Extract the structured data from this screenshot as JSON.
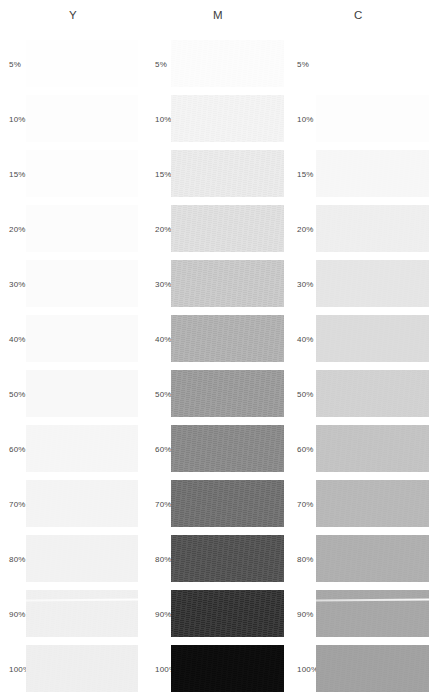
{
  "sheet": {
    "background": "#ffffff",
    "clipped_top_text": "",
    "label_color": "#4a4a4a",
    "header_color": "#3d3d3d"
  },
  "chart_data": {
    "type": "table",
    "title": "",
    "xlabel": "",
    "ylabel": "",
    "categories": [
      "5%",
      "10%",
      "15%",
      "20%",
      "30%",
      "40%",
      "50%",
      "60%",
      "70%",
      "80%",
      "90%",
      "100%"
    ],
    "series": [
      {
        "name": "Y",
        "values": [
          5,
          10,
          15,
          20,
          30,
          40,
          50,
          60,
          70,
          80,
          90,
          100
        ]
      },
      {
        "name": "M",
        "values": [
          5,
          10,
          15,
          20,
          30,
          40,
          50,
          60,
          70,
          80,
          90,
          100
        ]
      },
      {
        "name": "C",
        "values": [
          5,
          10,
          15,
          20,
          30,
          40,
          50,
          60,
          70,
          80,
          90,
          100
        ]
      }
    ]
  },
  "columns": [
    {
      "id": "y",
      "header": "Y",
      "steps": [
        {
          "label": "5%",
          "swatch": "#fefefe",
          "screen": 0.0,
          "streak": false
        },
        {
          "label": "10%",
          "swatch": "#fdfdfd",
          "screen": 0.0,
          "streak": false
        },
        {
          "label": "15%",
          "swatch": "#fdfdfd",
          "screen": 0.0,
          "streak": false
        },
        {
          "label": "20%",
          "swatch": "#fcfcfc",
          "screen": 0.0,
          "streak": false
        },
        {
          "label": "30%",
          "swatch": "#fbfbfb",
          "screen": 0.0,
          "streak": false
        },
        {
          "label": "40%",
          "swatch": "#fafafa",
          "screen": 0.0,
          "streak": false
        },
        {
          "label": "50%",
          "swatch": "#f8f8f8",
          "screen": 0.0,
          "streak": false
        },
        {
          "label": "60%",
          "swatch": "#f6f6f6",
          "screen": 0.05,
          "streak": false
        },
        {
          "label": "70%",
          "swatch": "#f4f4f4",
          "screen": 0.06,
          "streak": false
        },
        {
          "label": "80%",
          "swatch": "#f2f2f2",
          "screen": 0.07,
          "streak": false
        },
        {
          "label": "90%",
          "swatch": "#f0f0f0",
          "screen": 0.08,
          "streak": true
        },
        {
          "label": "100%",
          "swatch": "#efefef",
          "screen": 0.08,
          "streak": false
        }
      ]
    },
    {
      "id": "m",
      "header": "M",
      "steps": [
        {
          "label": "5%",
          "swatch": "#fcfcfc",
          "screen": 0.1,
          "streak": false
        },
        {
          "label": "10%",
          "swatch": "#f4f4f4",
          "screen": 0.22,
          "streak": false
        },
        {
          "label": "15%",
          "swatch": "#ebebeb",
          "screen": 0.3,
          "streak": false
        },
        {
          "label": "20%",
          "swatch": "#e0e0e0",
          "screen": 0.38,
          "streak": false
        },
        {
          "label": "30%",
          "swatch": "#cacaca",
          "screen": 0.46,
          "streak": false
        },
        {
          "label": "40%",
          "swatch": "#b2b2b2",
          "screen": 0.52,
          "streak": false
        },
        {
          "label": "50%",
          "swatch": "#9b9b9b",
          "screen": 0.58,
          "streak": false
        },
        {
          "label": "60%",
          "swatch": "#898989",
          "screen": 0.62,
          "streak": false
        },
        {
          "label": "70%",
          "swatch": "#6e6e6e",
          "screen": 0.68,
          "streak": false
        },
        {
          "label": "80%",
          "swatch": "#4f4f4f",
          "screen": 0.74,
          "streak": false
        },
        {
          "label": "90%",
          "swatch": "#2e2e2e",
          "screen": 0.85,
          "streak": false
        },
        {
          "label": "100%",
          "swatch": "#0a0a0a",
          "screen": 0.22,
          "streak": false
        }
      ]
    },
    {
      "id": "c",
      "header": "C",
      "steps": [
        {
          "label": "5%",
          "swatch": "#ffffff",
          "screen": 0.0,
          "streak": false
        },
        {
          "label": "10%",
          "swatch": "#fdfdfd",
          "screen": 0.0,
          "streak": false
        },
        {
          "label": "15%",
          "swatch": "#f7f7f7",
          "screen": 0.05,
          "streak": false
        },
        {
          "label": "20%",
          "swatch": "#efefef",
          "screen": 0.08,
          "streak": false
        },
        {
          "label": "30%",
          "swatch": "#e6e6e6",
          "screen": 0.1,
          "streak": false
        },
        {
          "label": "40%",
          "swatch": "#dcdcdc",
          "screen": 0.12,
          "streak": false
        },
        {
          "label": "50%",
          "swatch": "#d2d2d2",
          "screen": 0.14,
          "streak": false
        },
        {
          "label": "60%",
          "swatch": "#c4c4c4",
          "screen": 0.16,
          "streak": false
        },
        {
          "label": "70%",
          "swatch": "#b9b9b9",
          "screen": 0.18,
          "streak": false
        },
        {
          "label": "80%",
          "swatch": "#b0b0b0",
          "screen": 0.18,
          "streak": false
        },
        {
          "label": "90%",
          "swatch": "#a8a8a8",
          "screen": 0.18,
          "streak": true
        },
        {
          "label": "100%",
          "swatch": "#a2a2a2",
          "screen": 0.18,
          "streak": false
        }
      ]
    }
  ],
  "layout": {
    "row_pitch": 55,
    "row_height": 47,
    "first_row_top": 40
  }
}
